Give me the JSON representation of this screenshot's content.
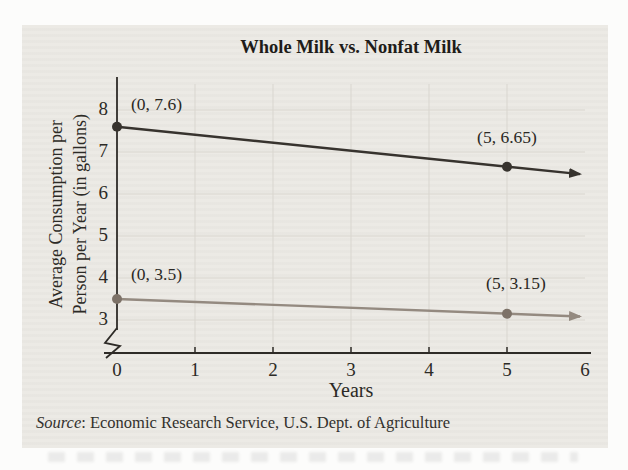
{
  "colors": {
    "page_bg": "#fcfcfb",
    "panel_bg": "#ebe9e4",
    "grid": "#d9d6cf",
    "axis": "#2e2b27",
    "whole_milk_line": "#37332e",
    "whole_milk_point": "#37332e",
    "nonfat_milk_line": "#948a80",
    "nonfat_milk_point": "#7d7268"
  },
  "chart": {
    "title": "Whole Milk vs. Nonfat Milk",
    "x_axis_label": "Years",
    "y_axis_label_line1": "Average Consumption per",
    "y_axis_label_line2": "Person per Year (in gallons)",
    "x_ticks": [
      "0",
      "1",
      "2",
      "3",
      "4",
      "5",
      "6"
    ],
    "y_ticks": [
      "8",
      "7",
      "6",
      "5",
      "4",
      "3"
    ],
    "source_prefix": "Source",
    "source_text": ": Economic Research Service, U.S. Dept. of Agriculture"
  },
  "chart_data": {
    "type": "line",
    "title": "Whole Milk vs. Nonfat Milk",
    "xlabel": "Years",
    "ylabel": "Average Consumption per Person per Year (in gallons)",
    "xlim": [
      0,
      6
    ],
    "ylim": [
      3,
      8
    ],
    "y_axis_break": true,
    "grid": true,
    "legend": "none",
    "x_tick_values": [
      0,
      1,
      2,
      3,
      4,
      5,
      6
    ],
    "y_tick_values": [
      8,
      7,
      6,
      5,
      4,
      3
    ],
    "series": [
      {
        "name": "Whole milk",
        "x": [
          0,
          5
        ],
        "y": [
          7.6,
          6.65
        ],
        "color": "#37332e",
        "point_color": "#37332e",
        "arrow_end": true
      },
      {
        "name": "Nonfat milk",
        "x": [
          0,
          5
        ],
        "y": [
          3.5,
          3.15
        ],
        "color": "#948a80",
        "point_color": "#7d7268",
        "arrow_end": true
      }
    ],
    "annotations": [
      {
        "text": "(0, 7.6)",
        "x": 0,
        "y": 7.6,
        "dx": 14,
        "dy": -33,
        "align": "left"
      },
      {
        "text": "(5, 6.65)",
        "x": 5,
        "y": 6.65,
        "dx": 0,
        "dy": -40,
        "align": "center"
      },
      {
        "text": "(0, 3.5)",
        "x": 0,
        "y": 3.5,
        "dx": 14,
        "dy": -35,
        "align": "left"
      },
      {
        "text": "(5, 3.15)",
        "x": 5,
        "y": 3.15,
        "dx": 9,
        "dy": -41,
        "align": "center"
      }
    ],
    "source": "Source: Economic Research Service, U.S. Dept. of Agriculture"
  }
}
